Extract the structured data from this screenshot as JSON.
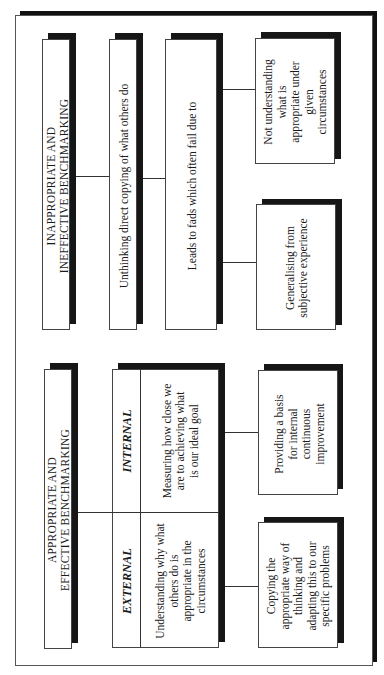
{
  "inappropriate": {
    "title_line1": "INAPPROPRIATE AND",
    "title_line2": "INEFFECTIVE BENCHMARKING",
    "step1": "Unthinking direct copying of what others do",
    "step2": "Leads to fads which often fail due to",
    "cause1_lines": [
      "Not understanding",
      "what is",
      "appropriate under",
      "given",
      "circumstances"
    ],
    "cause2_lines": [
      "Generalising from",
      "subjective experience"
    ]
  },
  "appropriate": {
    "title_line1": "APPROPRIATE AND",
    "title_line2": "EFFECTIVE BENCHMARKING",
    "internal": {
      "label": "INTERNAL",
      "text_lines": [
        "Measuring how close we",
        "are to achieving what",
        "is our ideal goal"
      ],
      "outcome_lines": [
        "Providing a basis",
        "for internal",
        "continuous",
        "improvement"
      ]
    },
    "external": {
      "label": "EXTERNAL",
      "text_lines": [
        "Understanding why what",
        "others do is",
        "appropriate in the",
        "circumstances"
      ],
      "outcome_lines": [
        "Copying the",
        "appropriate way of",
        "thinking and",
        "adapting this to our",
        "specific problems"
      ]
    }
  }
}
